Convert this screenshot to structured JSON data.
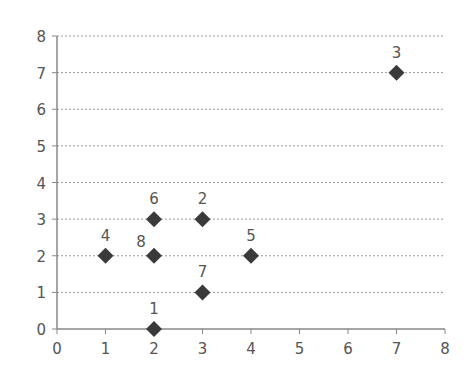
{
  "chart_data": {
    "type": "scatter",
    "title": "",
    "xlabel": "",
    "ylabel": "",
    "xlim": [
      0,
      8
    ],
    "ylim": [
      0,
      8
    ],
    "x_ticks": [
      0,
      1,
      2,
      3,
      4,
      5,
      6,
      7,
      8
    ],
    "y_ticks": [
      0,
      1,
      2,
      3,
      4,
      5,
      6,
      7,
      8
    ],
    "grid": {
      "horizontal": true,
      "vertical": false,
      "style": "dashed"
    },
    "legend": null,
    "marker": "diamond",
    "marker_color": "#3a3a3a",
    "points": [
      {
        "label": "1",
        "x": 2,
        "y": 0
      },
      {
        "label": "2",
        "x": 3,
        "y": 3
      },
      {
        "label": "3",
        "x": 7,
        "y": 7
      },
      {
        "label": "4",
        "x": 1,
        "y": 2
      },
      {
        "label": "5",
        "x": 4,
        "y": 2
      },
      {
        "label": "6",
        "x": 2,
        "y": 3
      },
      {
        "label": "7",
        "x": 3,
        "y": 1
      },
      {
        "label": "8",
        "x": 2,
        "y": 2
      }
    ]
  },
  "colors": {
    "axis": "#888888",
    "grid": "#999999",
    "marker": "#3a3a3a",
    "text": "#555555"
  }
}
